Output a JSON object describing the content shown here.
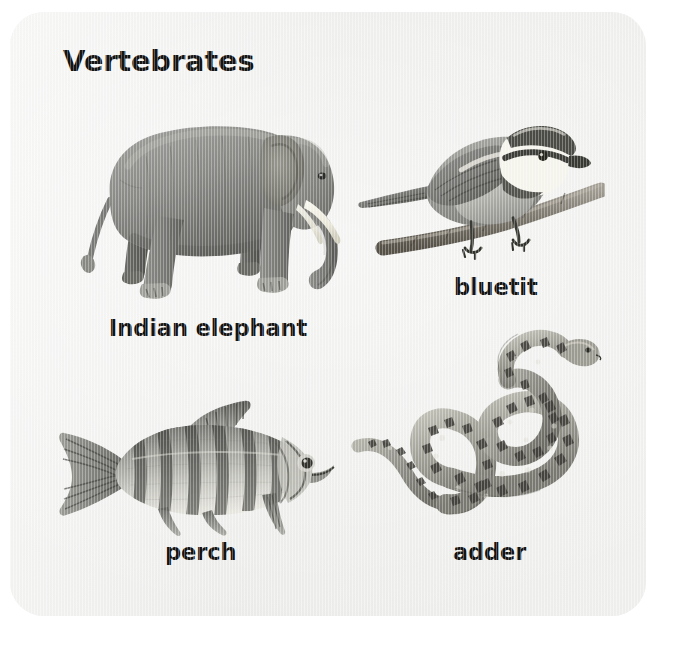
{
  "figure": {
    "title": "Vertebrates",
    "background_color": "#eeeeec",
    "page_color": "#ffffff",
    "text_color": "#141414"
  },
  "specimens": [
    {
      "id": "indian-elephant",
      "caption": "Indian elephant",
      "group": "mammal",
      "position": "top-left",
      "facing": "right",
      "body_color": "#8d8d8b",
      "accent_color": "#f2efe4"
    },
    {
      "id": "bluetit",
      "caption": "bluetit",
      "group": "bird",
      "position": "top-right",
      "facing": "right",
      "body_color": "#9a9a98",
      "accent_color": "#fbfbf8"
    },
    {
      "id": "perch",
      "caption": "perch",
      "group": "fish",
      "position": "bottom-left",
      "facing": "right",
      "body_color": "#9e9e9b",
      "accent_color": "#4e4e4c"
    },
    {
      "id": "adder",
      "caption": "adder",
      "group": "reptile",
      "position": "bottom-right",
      "facing": "up-right",
      "body_color": "#9b9a95",
      "accent_color": "#3a3a37"
    }
  ]
}
